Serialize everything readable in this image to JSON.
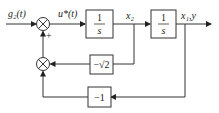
{
  "diagram": {
    "type": "block-diagram",
    "signals": {
      "input": "g₂(t)",
      "control": "u*(t)",
      "state2": "x₂",
      "output": "x₁,y"
    },
    "blocks": {
      "integrator1": {
        "num": "1",
        "den": "s"
      },
      "integrator2": {
        "num": "1",
        "den": "s"
      },
      "gain_sqrt2": "−√2",
      "gain_one": "−1"
    },
    "summer_sign": "+",
    "colors": {
      "line": "#2a2a2a",
      "background": "#ffffff"
    }
  }
}
